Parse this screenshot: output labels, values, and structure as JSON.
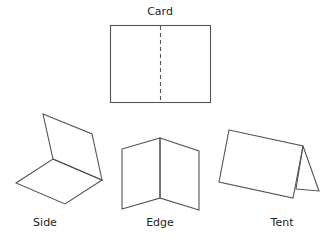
{
  "diagram": {
    "title": "Card",
    "stroke_color": "#555555",
    "text_color": "#222222",
    "card": {
      "label": "Card",
      "rect": {
        "x": 110,
        "y": 25,
        "width": 100,
        "height": 77
      },
      "fold_line": {
        "x": 160,
        "y1": 25,
        "y2": 102,
        "style": "dashed"
      }
    },
    "folds": [
      {
        "label": "Side",
        "label_x": 45,
        "label_y": 220
      },
      {
        "label": "Edge",
        "label_x": 160,
        "label_y": 220
      },
      {
        "label": "Tent",
        "label_x": 282,
        "label_y": 220
      }
    ]
  }
}
